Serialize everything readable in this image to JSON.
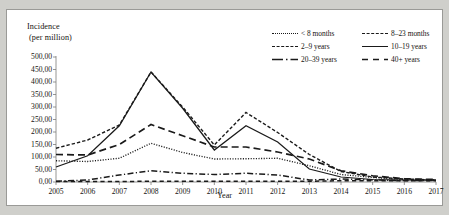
{
  "figure": {
    "y_axis_title_line1": "Incidence",
    "y_axis_title_line2": "(per million)",
    "x_axis_title": "Year"
  },
  "legend": {
    "items": [
      {
        "label": "< 8 months",
        "style": "dotted"
      },
      {
        "label": "8–23 months",
        "style": "long-dash"
      },
      {
        "label": "2–9 years",
        "style": "short-dash"
      },
      {
        "label": "10–19 years",
        "style": "solid"
      },
      {
        "label": "20–39 years",
        "style": "dash-dot"
      },
      {
        "label": "40+ years",
        "style": "dashed"
      }
    ]
  },
  "chart_data": {
    "type": "line",
    "title": "",
    "xlabel": "Year",
    "ylabel": "Incidence (per million)",
    "grid": false,
    "legend_position": "top-right",
    "x": [
      2005,
      2006,
      2007,
      2008,
      2009,
      2010,
      2011,
      2012,
      2013,
      2014,
      2015,
      2016,
      2017
    ],
    "xtick_labels": [
      "2005",
      "2006",
      "2007",
      "2008",
      "2009",
      "2010",
      "2011",
      "2012",
      "2013",
      "2014",
      "2015",
      "2016",
      "2017"
    ],
    "ytick_labels": [
      "0,00",
      "50,00",
      "100,00",
      "150,00",
      "200,00",
      "250,00",
      "300,00",
      "350,00",
      "400,00",
      "450,00",
      "500,00"
    ],
    "ylim": [
      0,
      500
    ],
    "ytick_step": 50,
    "series": [
      {
        "name": "< 8 months",
        "style": "dotted",
        "values": [
          85,
          82,
          95,
          155,
          118,
          92,
          93,
          95,
          65,
          30,
          18,
          10,
          8
        ]
      },
      {
        "name": "8–23 months",
        "style": "long-dash",
        "values": [
          110,
          108,
          150,
          230,
          185,
          140,
          140,
          120,
          92,
          45,
          25,
          13,
          10
        ]
      },
      {
        "name": "2–9 years",
        "style": "short-dash",
        "values": [
          135,
          168,
          228,
          440,
          300,
          148,
          278,
          198,
          110,
          42,
          20,
          12,
          8
        ]
      },
      {
        "name": "10–19 years",
        "style": "solid",
        "values": [
          60,
          105,
          225,
          440,
          295,
          128,
          225,
          160,
          52,
          20,
          10,
          8,
          7
        ]
      },
      {
        "name": "20–39 years",
        "style": "dash-dot",
        "values": [
          3,
          8,
          28,
          45,
          35,
          30,
          35,
          28,
          8,
          12,
          8,
          6,
          6
        ]
      },
      {
        "name": "40+ years",
        "style": "dashed",
        "values": [
          2,
          2,
          2,
          3,
          3,
          3,
          3,
          3,
          3,
          5,
          5,
          5,
          5
        ]
      }
    ]
  }
}
